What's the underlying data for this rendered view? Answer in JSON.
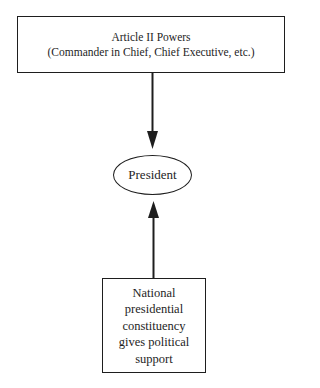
{
  "diagram": {
    "type": "flow",
    "nodes": [
      {
        "id": "article-ii-powers",
        "shape": "rectangle",
        "lines": [
          "Article II Powers",
          "(Commander in Chief, Chief Executive, etc.)"
        ]
      },
      {
        "id": "president",
        "shape": "ellipse",
        "label": "President"
      },
      {
        "id": "national-constituency",
        "shape": "rectangle",
        "lines": [
          "National",
          "presidential",
          "constituency",
          "gives political",
          "support"
        ]
      }
    ],
    "edges": [
      {
        "from": "article-ii-powers",
        "to": "president",
        "direction": "down"
      },
      {
        "from": "national-constituency",
        "to": "president",
        "direction": "up"
      }
    ],
    "colors": {
      "stroke": "#1e1e1e",
      "background": "#ffffff"
    }
  },
  "top_box": {
    "title": "Article II Powers",
    "subtitle": "(Commander in Chief, Chief Executive, etc.)"
  },
  "center": {
    "label": "President"
  },
  "bottom_box": {
    "lines": [
      "National",
      "presidential",
      "constituency",
      "gives political",
      "support"
    ]
  }
}
